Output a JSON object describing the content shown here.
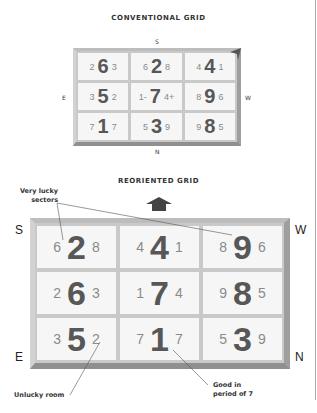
{
  "conventional": {
    "title": "CONVENTIONAL GRID",
    "directions": {
      "top": "S",
      "left": "E",
      "right": "W",
      "bottom": "N"
    },
    "cells": [
      [
        {
          "l": "2",
          "c": "6",
          "r": "3"
        },
        {
          "l": "6",
          "c": "2",
          "r": "8"
        },
        {
          "l": "4",
          "c": "4",
          "r": "1"
        }
      ],
      [
        {
          "l": "3",
          "c": "5",
          "r": "2"
        },
        {
          "l": "1-",
          "c": "7",
          "r": "4+"
        },
        {
          "l": "8",
          "c": "9",
          "r": "6"
        }
      ],
      [
        {
          "l": "7",
          "c": "1",
          "r": "7"
        },
        {
          "l": "5",
          "c": "3",
          "r": "9"
        },
        {
          "l": "9",
          "c": "8",
          "r": "5"
        }
      ]
    ]
  },
  "reoriented": {
    "title": "REORIENTED GRID",
    "directions": {
      "top_left": "S",
      "top_right": "W",
      "bottom_left": "E",
      "bottom_right": "N"
    },
    "cells": [
      [
        {
          "l": "6",
          "c": "2",
          "r": "8"
        },
        {
          "l": "4",
          "c": "4",
          "r": "1"
        },
        {
          "l": "8",
          "c": "9",
          "r": "6"
        }
      ],
      [
        {
          "l": "2",
          "c": "6",
          "r": "3"
        },
        {
          "l": "1",
          "c": "7",
          "r": "4"
        },
        {
          "l": "9",
          "c": "8",
          "r": "5"
        }
      ],
      [
        {
          "l": "3",
          "c": "5",
          "r": "2"
        },
        {
          "l": "7",
          "c": "1",
          "r": "7"
        },
        {
          "l": "5",
          "c": "3",
          "r": "9"
        }
      ]
    ]
  },
  "annotations": {
    "very_lucky_1": "Very lucky",
    "very_lucky_2": "sectors",
    "unlucky": "Unlucky room",
    "good_1": "Good in",
    "good_2": "period of 7"
  },
  "icons": {
    "arrow": "up-arrow-icon",
    "corner": "corner-pointer-icon"
  },
  "colors": {
    "frame": "#c9c9c9",
    "cell": "#f6f6f6",
    "number_big": "#575757",
    "number_small": "#8a8a8a",
    "arrow": "#444444"
  }
}
